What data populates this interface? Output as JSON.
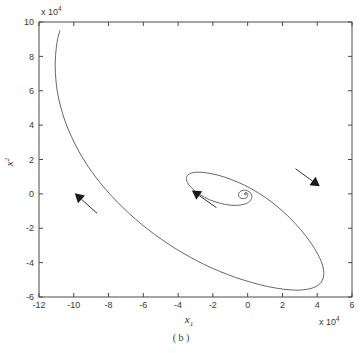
{
  "figure": {
    "caption": "( b )",
    "background_color": "#ffffff",
    "curve_color": "#555555",
    "axis_color": "#4a4a4a",
    "arrow_color": "#1a1a1a"
  },
  "chart_data": {
    "type": "line",
    "title": "",
    "subtitle": "",
    "xlabel": "x",
    "xlabel_sub": "1",
    "ylabel": "x",
    "ylabel_sub": "2",
    "x_multiplier": "x 10",
    "x_multiplier_exp": "4",
    "y_multiplier": "x 10",
    "y_multiplier_exp": "4",
    "xlim": [
      -12,
      6
    ],
    "ylim": [
      -6,
      10
    ],
    "xticks": [
      -12,
      -10,
      -8,
      -6,
      -4,
      -2,
      0,
      2,
      4,
      6
    ],
    "xticklabels": [
      "-12",
      "-10",
      "-8",
      "-6",
      "-4",
      "-2",
      "0",
      "2",
      "4",
      "6"
    ],
    "yticks": [
      -6,
      -4,
      -2,
      0,
      2,
      4,
      6,
      8,
      10
    ],
    "yticklabels": [
      "-6",
      "-4",
      "-2",
      "0",
      "2",
      "4",
      "6",
      "8",
      "10"
    ],
    "grid": false,
    "legend": null,
    "legend_position": "none",
    "series": [
      {
        "name": "trajectory",
        "description": "inward spiral phase trajectory, units of 10^4",
        "points": [
          [
            -10.8,
            9.5
          ],
          [
            -10.92,
            9.05
          ],
          [
            -11.0,
            8.55
          ],
          [
            -11.05,
            8.05
          ],
          [
            -11.07,
            7.55
          ],
          [
            -11.06,
            7.05
          ],
          [
            -11.02,
            6.55
          ],
          [
            -10.96,
            6.05
          ],
          [
            -10.88,
            5.6
          ],
          [
            -10.77,
            5.12
          ],
          [
            -10.64,
            4.66
          ],
          [
            -10.49,
            4.2
          ],
          [
            -10.32,
            3.76
          ],
          [
            -10.13,
            3.32
          ],
          [
            -9.93,
            2.9
          ],
          [
            -9.71,
            2.48
          ],
          [
            -9.48,
            2.08
          ],
          [
            -9.23,
            1.68
          ],
          [
            -8.97,
            1.3
          ],
          [
            -8.7,
            0.92
          ],
          [
            -8.41,
            0.56
          ],
          [
            -8.11,
            0.2
          ],
          [
            -7.8,
            -0.15
          ],
          [
            -7.48,
            -0.49
          ],
          [
            -7.15,
            -0.82
          ],
          [
            -6.81,
            -1.15
          ],
          [
            -6.46,
            -1.46
          ],
          [
            -6.1,
            -1.77
          ],
          [
            -5.73,
            -2.07
          ],
          [
            -5.35,
            -2.36
          ],
          [
            -4.96,
            -2.64
          ],
          [
            -4.57,
            -2.91
          ],
          [
            -4.17,
            -3.17
          ],
          [
            -3.76,
            -3.42
          ],
          [
            -3.34,
            -3.66
          ],
          [
            -2.92,
            -3.89
          ],
          [
            -2.49,
            -4.11
          ],
          [
            -2.05,
            -4.32
          ],
          [
            -1.61,
            -4.51
          ],
          [
            -1.16,
            -4.69
          ],
          [
            -0.71,
            -4.86
          ],
          [
            -0.25,
            -5.01
          ],
          [
            0.21,
            -5.15
          ],
          [
            0.68,
            -5.28
          ],
          [
            1.15,
            -5.39
          ],
          [
            1.62,
            -5.48
          ],
          [
            2.08,
            -5.55
          ],
          [
            2.53,
            -5.59
          ],
          [
            2.96,
            -5.6
          ],
          [
            3.36,
            -5.56
          ],
          [
            3.72,
            -5.48
          ],
          [
            4.02,
            -5.34
          ],
          [
            4.23,
            -5.14
          ],
          [
            4.35,
            -4.88
          ],
          [
            4.38,
            -4.58
          ],
          [
            4.33,
            -4.25
          ],
          [
            4.22,
            -3.9
          ],
          [
            4.05,
            -3.54
          ],
          [
            3.84,
            -3.17
          ],
          [
            3.6,
            -2.8
          ],
          [
            3.33,
            -2.43
          ],
          [
            3.04,
            -2.07
          ],
          [
            2.73,
            -1.72
          ],
          [
            2.41,
            -1.38
          ],
          [
            2.07,
            -1.06
          ],
          [
            1.72,
            -0.75
          ],
          [
            1.36,
            -0.46
          ],
          [
            0.99,
            -0.19
          ],
          [
            0.61,
            0.06
          ],
          [
            0.22,
            0.29
          ],
          [
            -0.17,
            0.5
          ],
          [
            -0.57,
            0.68
          ],
          [
            -0.96,
            0.84
          ],
          [
            -1.34,
            0.98
          ],
          [
            -1.71,
            1.09
          ],
          [
            -2.06,
            1.17
          ],
          [
            -2.39,
            1.23
          ],
          [
            -2.69,
            1.26
          ],
          [
            -2.95,
            1.26
          ],
          [
            -3.17,
            1.23
          ],
          [
            -3.34,
            1.17
          ],
          [
            -3.46,
            1.08
          ],
          [
            -3.52,
            0.96
          ],
          [
            -3.52,
            0.82
          ],
          [
            -3.46,
            0.66
          ],
          [
            -3.35,
            0.49
          ],
          [
            -3.19,
            0.31
          ],
          [
            -2.99,
            0.13
          ],
          [
            -2.75,
            -0.04
          ],
          [
            -2.48,
            -0.2
          ],
          [
            -2.19,
            -0.34
          ],
          [
            -1.88,
            -0.46
          ],
          [
            -1.57,
            -0.55
          ],
          [
            -1.26,
            -0.62
          ],
          [
            -0.96,
            -0.66
          ],
          [
            -0.68,
            -0.67
          ],
          [
            -0.42,
            -0.65
          ],
          [
            -0.2,
            -0.6
          ],
          [
            -0.02,
            -0.53
          ],
          [
            0.11,
            -0.43
          ],
          [
            0.2,
            -0.32
          ],
          [
            0.24,
            -0.2
          ],
          [
            0.23,
            -0.08
          ],
          [
            0.18,
            0.03
          ],
          [
            0.1,
            0.12
          ],
          [
            -0.01,
            0.18
          ],
          [
            -0.13,
            0.21
          ],
          [
            -0.25,
            0.21
          ],
          [
            -0.36,
            0.18
          ],
          [
            -0.45,
            0.12
          ],
          [
            -0.51,
            0.04
          ],
          [
            -0.53,
            -0.05
          ],
          [
            -0.51,
            -0.14
          ],
          [
            -0.45,
            -0.21
          ],
          [
            -0.37,
            -0.26
          ],
          [
            -0.27,
            -0.28
          ],
          [
            -0.17,
            -0.27
          ],
          [
            -0.09,
            -0.23
          ],
          [
            -0.03,
            -0.17
          ],
          [
            0.0,
            -0.1
          ],
          [
            0.01,
            -0.03
          ],
          [
            -0.01,
            0.03
          ],
          [
            -0.05,
            0.07
          ],
          [
            -0.1,
            0.08
          ],
          [
            -0.15,
            0.06
          ],
          [
            -0.18,
            0.02
          ],
          [
            -0.18,
            -0.02
          ],
          [
            -0.16,
            -0.05
          ],
          [
            -0.12,
            -0.06
          ],
          [
            -0.09,
            -0.04
          ],
          [
            -0.07,
            -0.01
          ],
          [
            -0.08,
            0.01
          ],
          [
            -0.1,
            0.02
          ],
          [
            -0.12,
            0.01
          ],
          [
            -0.12,
            -0.01
          ],
          [
            -0.11,
            -0.02
          ],
          [
            -0.1,
            -0.01
          ]
        ]
      }
    ],
    "annotations": [
      {
        "name": "arrow-left-branch",
        "x": -9.3,
        "y": -0.55,
        "direction": "up-left",
        "angle_deg": 222
      },
      {
        "name": "arrow-spiral-inner",
        "x": -2.5,
        "y": -0.3,
        "direction": "up-left",
        "angle_deg": 215
      },
      {
        "name": "arrow-right-branch",
        "x": 3.45,
        "y": 0.95,
        "direction": "down-right",
        "angle_deg": 36
      }
    ]
  }
}
